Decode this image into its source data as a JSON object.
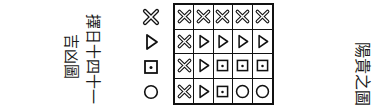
{
  "left_text": {
    "line1": "擇日十四十一",
    "line2": "吉凶圖"
  },
  "right_text": "陽貴之圖",
  "legend": [
    "cross",
    "triangle",
    "dotted-square",
    "circle"
  ],
  "grid": {
    "rows": 4,
    "cols": 5,
    "cells": [
      [
        "cross",
        "cross",
        "cross",
        "cross",
        "cross"
      ],
      [
        "cross",
        "triangle",
        "triangle",
        "triangle",
        "triangle"
      ],
      [
        "cross",
        "triangle",
        "dotted-square",
        "dotted-square",
        "dotted-square"
      ],
      [
        "cross",
        "triangle",
        "dotted-square",
        "circle",
        "circle"
      ]
    ]
  },
  "colors": {
    "ink": "#111111",
    "paper": "#ffffff"
  }
}
